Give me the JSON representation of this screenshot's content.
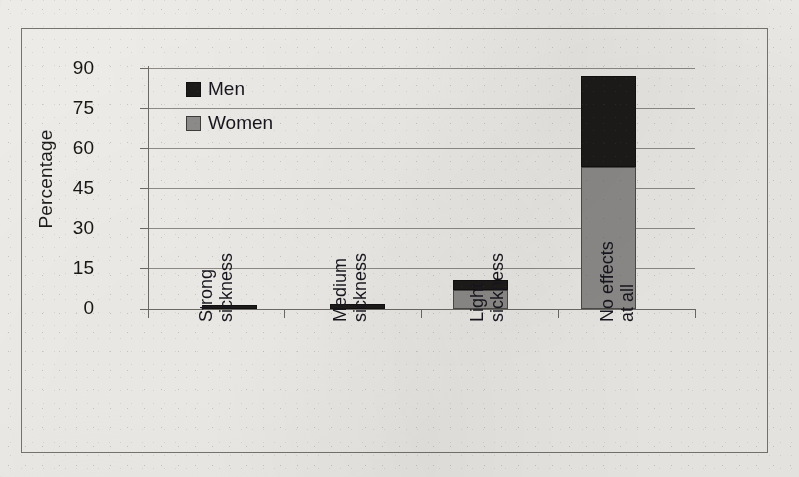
{
  "chart_data": {
    "type": "bar",
    "subtype": "stacked-bar",
    "title": "",
    "xlabel": "",
    "ylabel": "Percentage",
    "ylim": [
      0,
      90
    ],
    "yticks": [
      0,
      15,
      30,
      45,
      60,
      75,
      90
    ],
    "grid": true,
    "legend_position": "top-left inside plot",
    "categories": [
      "Strong sickness",
      "Medium sickness",
      "Light sickness",
      "No effects at all"
    ],
    "category_lines": [
      [
        "Strong",
        "sickness"
      ],
      [
        "Medium",
        "sickness"
      ],
      [
        "Light",
        "sickness"
      ],
      [
        "No effects",
        "at all"
      ]
    ],
    "series": [
      {
        "name": "Women",
        "color": "#8d8c8a",
        "values": [
          0,
          0,
          7,
          53
        ]
      },
      {
        "name": "Men",
        "color": "#1c1b1a",
        "values": [
          1.5,
          2,
          4,
          34
        ]
      }
    ],
    "stack_totals": [
      1.5,
      2,
      11,
      87
    ]
  },
  "axis": {
    "y_title": "Percentage",
    "y_tick_labels": [
      "90",
      "75",
      "60",
      "45",
      "30",
      "15",
      "0"
    ]
  },
  "legend": {
    "items": [
      {
        "label": "Men",
        "swatch": "men-swatch",
        "color": "#1c1b1a"
      },
      {
        "label": "Women",
        "swatch": "women-swatch",
        "color": "#8d8c8a"
      }
    ]
  }
}
